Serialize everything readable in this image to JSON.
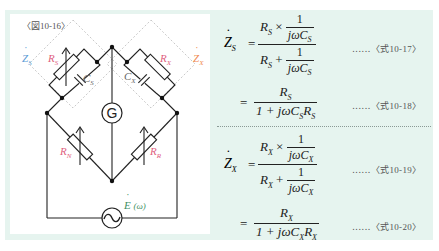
{
  "figure": {
    "label": "〈図10-16〉",
    "labels": {
      "zs": "Z",
      "zs_sub": "S",
      "zx": "Z",
      "zx_sub": "X",
      "rs": "R",
      "rs_sub": "S",
      "cs": "C",
      "cs_sub": "S",
      "rx": "R",
      "rx_sub": "X",
      "cx": "C",
      "cx_sub": "X",
      "rn": "R",
      "rn_sub": "N",
      "rr": "R",
      "rr_sub": "R",
      "galvanometer": "G",
      "source": "E",
      "source_arg": "(ω)"
    },
    "colors": {
      "zs": "#5b9bd5",
      "zx": "#f08a50",
      "resistor_labels": "#e0607e",
      "capacitor_labels": "#666666",
      "source_label": "#3e8f62",
      "panel_bg": "#e6f4ef"
    }
  },
  "equations": [
    {
      "lhs": "Z",
      "lhs_sub": "S",
      "num_top": "R",
      "num_top_sub": "S",
      "times": "×",
      "one": "1",
      "jw": "jωC",
      "c_sub": "S",
      "plus": "+",
      "ref": "‥‥‥〈式10-17〉"
    },
    {
      "equals": "=",
      "num": "R",
      "num_sub": "S",
      "den_pre": "1 + jωC",
      "den_c_sub": "S",
      "den_r": "R",
      "den_r_sub": "S",
      "ref": "‥‥‥〈式10-18〉"
    },
    {
      "lhs": "Z",
      "lhs_sub": "X",
      "num_top": "R",
      "num_top_sub": "X",
      "times": "×",
      "one": "1",
      "jw": "jωC",
      "c_sub": "X",
      "plus": "+",
      "ref": "‥‥‥〈式10-19〉"
    },
    {
      "equals": "=",
      "num": "R",
      "num_sub": "X",
      "den_pre": "1 + jωC",
      "den_c_sub": "X",
      "den_r": "R",
      "den_r_sub": "X",
      "ref": "‥‥‥〈式10-20〉"
    }
  ]
}
